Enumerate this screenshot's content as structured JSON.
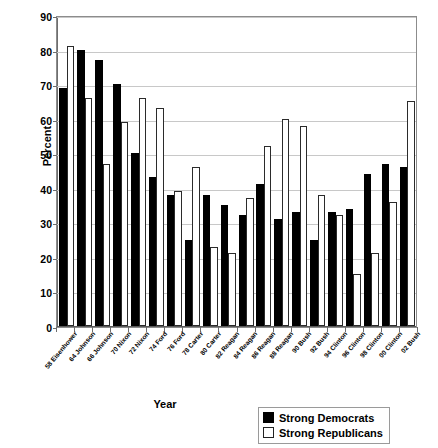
{
  "chart_data": {
    "type": "bar",
    "title": "",
    "xlabel": "Year",
    "ylabel": "Percent",
    "ylim": [
      0,
      90
    ],
    "ytick_step": 10,
    "yticks": [
      0,
      10,
      20,
      30,
      40,
      50,
      60,
      70,
      80,
      90
    ],
    "grid": true,
    "legend_position": "bottom-right",
    "categories": [
      "58 Eisenhower",
      "64 Johnson",
      "66 Johnson",
      "70 Nixon",
      "72 Nixon",
      "74 Ford",
      "76 Ford",
      "78 Carter",
      "80 Carter",
      "82 Reagan",
      "84 Reagan",
      "86 Reagan",
      "88 Reagan",
      "90 Bush",
      "92 Bush",
      "94 Clinton",
      "96 Clinton",
      "98 Clinton",
      "00 Clinton",
      "02 Bush"
    ],
    "series": [
      {
        "name": "Strong Democrats",
        "color": "#000000",
        "values": [
          69,
          80,
          77,
          70,
          50,
          43,
          38,
          25,
          38,
          35,
          32,
          41,
          31,
          33,
          25,
          33,
          34,
          44,
          47,
          46
        ]
      },
      {
        "name": "Strong Republicans",
        "color": "#ffffff",
        "values": [
          81,
          66,
          47,
          59,
          66,
          63,
          39,
          46,
          23,
          21,
          37,
          52,
          60,
          58,
          38,
          32,
          15,
          21,
          36,
          65
        ]
      }
    ]
  },
  "legend": {
    "items": [
      {
        "label": "Strong Democrats",
        "marker": "filled-square"
      },
      {
        "label": "Strong Republicans",
        "marker": "hollow-square"
      }
    ]
  }
}
